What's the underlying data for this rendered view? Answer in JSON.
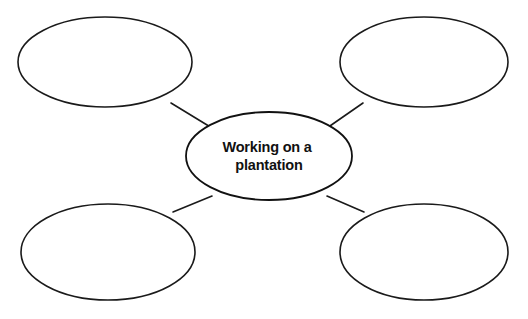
{
  "diagram": {
    "type": "web-graphic-organizer",
    "background_color": "#ffffff",
    "stroke_color": "#1a1a1a",
    "text_color": "#111111",
    "center": {
      "label_line1": "Working on a",
      "label_line2": "plantation",
      "full_label": "Working on a plantation",
      "cx": 269,
      "cy": 156,
      "rx": 83,
      "ry": 44
    },
    "outer_nodes": [
      {
        "name": "top-left",
        "label": "",
        "cx": 105,
        "cy": 62,
        "rx": 87,
        "ry": 45
      },
      {
        "name": "top-right",
        "label": "",
        "cx": 424,
        "cy": 62,
        "rx": 84,
        "ry": 45
      },
      {
        "name": "bottom-left",
        "label": "",
        "cx": 108,
        "cy": 252,
        "rx": 87,
        "ry": 48
      },
      {
        "name": "bottom-right",
        "label": "",
        "cx": 424,
        "cy": 252,
        "rx": 84,
        "ry": 48
      }
    ],
    "connectors": [
      {
        "name": "center-to-top-left",
        "x1": 212,
        "y1": 128,
        "x2": 171,
        "y2": 103
      },
      {
        "name": "center-to-top-right",
        "x1": 327,
        "y1": 128,
        "x2": 363,
        "y2": 103
      },
      {
        "name": "center-to-bottom-left",
        "x1": 212,
        "y1": 196,
        "x2": 173,
        "y2": 212
      },
      {
        "name": "center-to-bottom-right",
        "x1": 327,
        "y1": 196,
        "x2": 364,
        "y2": 212
      }
    ]
  }
}
